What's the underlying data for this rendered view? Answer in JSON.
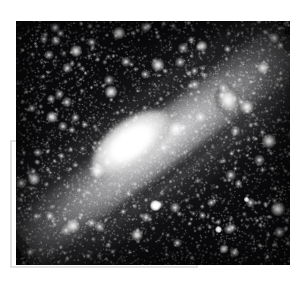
{
  "page": {
    "kind": "astronomical-photograph",
    "background_color": "#ffffff",
    "width": 306,
    "height": 283
  },
  "photo": {
    "name": "andromeda-galaxy-plate",
    "alt_text": "Black and white astronomical photograph of a large tilted spiral galaxy with a bright elongated nucleus, a smaller elliptical companion galaxy at upper right, and a dense field of stars",
    "left": 16,
    "top": 21,
    "width": 274,
    "height": 244,
    "plate_color": "#0a0a0c",
    "tone": "grayscale-negative-print"
  },
  "ghost_frame": {
    "name": "offset-outline-frame",
    "left": 10,
    "top": 140,
    "width": 188,
    "height": 128,
    "border_color": "#e2e2e2",
    "border_width": 2
  },
  "features": [
    {
      "name": "spiral-galaxy-disk",
      "label": "Spiral galaxy disk",
      "position_angle_deg": -37,
      "center_x_pct": 46,
      "center_y_pct": 52,
      "brightness": "bright"
    },
    {
      "name": "galaxy-nucleus",
      "label": "Galaxy nucleus",
      "center_x_pct": 42,
      "center_y_pct": 50,
      "brightness": "saturated-white"
    },
    {
      "name": "dust-lane-upper",
      "label": "Upper dust lane",
      "brightness": "dark"
    },
    {
      "name": "dust-lane-lower",
      "label": "Lower dust lane",
      "brightness": "dark"
    },
    {
      "name": "companion-elliptical-galaxy",
      "label": "Companion elliptical galaxy",
      "x": 199,
      "y": 63,
      "brightness": "bright"
    },
    {
      "name": "foreground-star-primary",
      "label": "Bright foreground star",
      "x": 134,
      "y": 179,
      "brightness": "bright"
    },
    {
      "name": "foreground-star-secondary",
      "label": "Foreground star",
      "x": 199,
      "y": 205,
      "brightness": "medium"
    },
    {
      "name": "foreground-star-tertiary",
      "label": "Foreground star",
      "x": 228,
      "y": 176,
      "brightness": "medium"
    },
    {
      "name": "star-field",
      "label": "Dense background star field",
      "brightness": "faint"
    }
  ],
  "colors": {
    "plate_dark": "#0a0a0c",
    "plate_mid": "#6e6e70",
    "plate_bright": "#ffffff",
    "page_background": "#ffffff",
    "frame_gray": "#e2e2e2"
  }
}
